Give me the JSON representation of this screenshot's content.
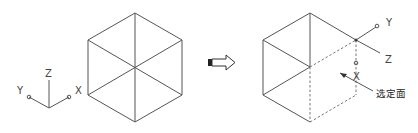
{
  "figure": {
    "left": {
      "ucs_labels": {
        "x": "X",
        "y": "Y",
        "z": "Z"
      }
    },
    "arrow": {
      "direction": "right"
    },
    "right": {
      "ucs_labels": {
        "x": "X",
        "y": "Y",
        "z": "Z"
      },
      "callout": "选定面"
    }
  },
  "colors": {
    "line": "#555555",
    "background": "#ffffff"
  }
}
